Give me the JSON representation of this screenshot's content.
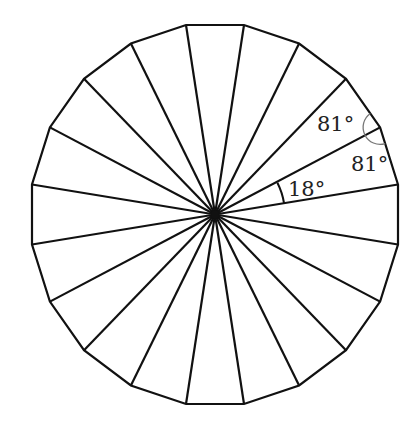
{
  "diagram": {
    "shape": "regular-polygon",
    "sides": 20,
    "center": [
      215,
      214.5
    ],
    "circumradius_x": 185.3,
    "circumradius_y": 191.9,
    "start_angle_deg": 9,
    "stroke_color": "#111111",
    "stroke_width": 2.2,
    "center_dot_radius": 4,
    "angle_marks": [
      {
        "name": "central-angle",
        "value": "18°",
        "vertex": "center",
        "arc_radius": 70,
        "from_deg": 9,
        "to_deg": 27,
        "color": "#111111"
      },
      {
        "name": "base-angle-upper",
        "value": "81°",
        "vertex_index": 1,
        "arc_radius": 17,
        "color": "#777777"
      },
      {
        "name": "base-angle-lower",
        "value": "81°",
        "vertex_index": 1,
        "arc_radius": 17,
        "color": "#777777"
      }
    ],
    "labels": [
      {
        "name": "label-18",
        "text": "18°",
        "x": 288,
        "y": 196
      },
      {
        "name": "label-81-upper",
        "text": "81°",
        "x": 317,
        "y": 131
      },
      {
        "name": "label-81-lower",
        "text": "81°",
        "x": 351,
        "y": 171
      }
    ]
  }
}
